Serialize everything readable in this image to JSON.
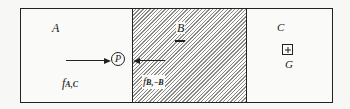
{
  "diagram": {
    "regions": [
      {
        "id": "A",
        "label": "A",
        "fill": "plain"
      },
      {
        "id": "B",
        "label": "B",
        "fill": "hatched",
        "underline": true
      },
      {
        "id": "C",
        "label": "C",
        "fill": "plain"
      }
    ],
    "point": {
      "label": "P"
    },
    "center": {
      "label": "G"
    },
    "forces": [
      {
        "label_main": "f",
        "label_sub": "A,C",
        "direction": "right"
      },
      {
        "label_main": "f",
        "label_sub": "B,−B",
        "direction": "left"
      }
    ],
    "colors": {
      "line": "#222222",
      "hatch": "#8a8a8a",
      "background": "#fafaf8"
    }
  }
}
